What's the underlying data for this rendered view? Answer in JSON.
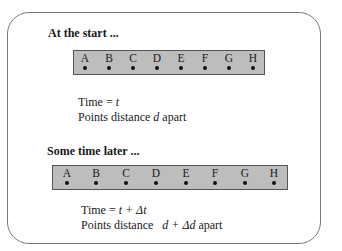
{
  "panel1": {
    "heading": "At the start ...",
    "points": [
      "A",
      "B",
      "C",
      "D",
      "E",
      "F",
      "G",
      "H"
    ],
    "time_label": "Time = ",
    "time_var": "t",
    "dist_prefix": "Points distance ",
    "dist_var": "d",
    "dist_suffix": " apart"
  },
  "panel2": {
    "heading": "Some time later ...",
    "points": [
      "A",
      "B",
      "C",
      "D",
      "E",
      "F",
      "G",
      "H"
    ],
    "time_label": "Time = ",
    "time_var": "t + Δt",
    "dist_prefix": "Points distance ",
    "dist_var": "d + Δd",
    "dist_suffix": " apart"
  }
}
